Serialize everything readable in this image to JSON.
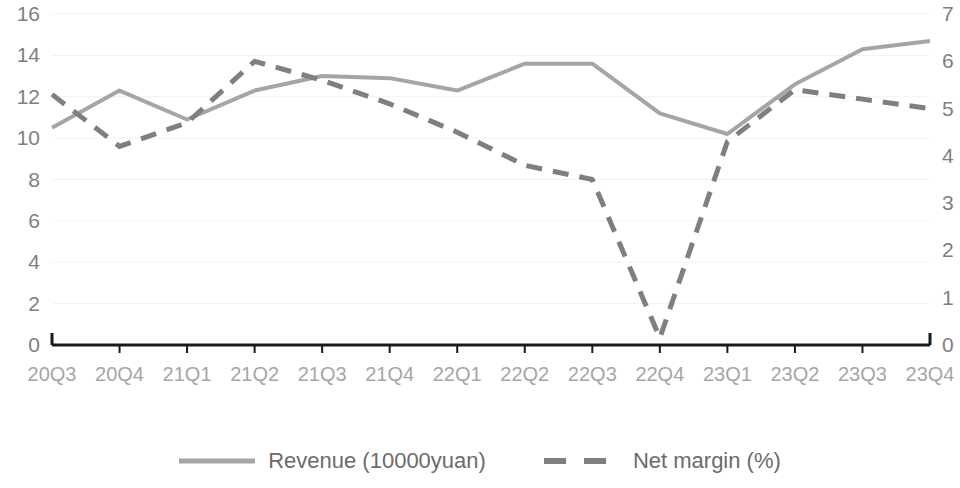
{
  "chart_data": {
    "type": "line",
    "title": "",
    "xlabel": "",
    "categories": [
      "20Q3",
      "20Q4",
      "21Q1",
      "21Q2",
      "21Q3",
      "21Q4",
      "22Q1",
      "22Q2",
      "22Q3",
      "22Q4",
      "23Q1",
      "23Q2",
      "23Q3",
      "23Q4"
    ],
    "grid": true,
    "legend_position": "bottom",
    "series": [
      {
        "name": "Revenue (10000yuan)",
        "axis": "left",
        "style": "solid",
        "color": "#a5a5a5",
        "ylabel": "Revenue (10000yuan)",
        "ylim": [
          0,
          16
        ],
        "yticks": [
          0,
          2,
          4,
          6,
          8,
          10,
          12,
          14,
          16
        ],
        "values": [
          10.5,
          12.3,
          10.9,
          12.3,
          13.0,
          12.9,
          12.3,
          13.6,
          13.6,
          11.2,
          10.2,
          12.6,
          14.3,
          14.7
        ]
      },
      {
        "name": "Net margin (%)",
        "axis": "right",
        "style": "dashed",
        "color": "#7f7f7f",
        "ylabel": "Net margin (%)",
        "ylim": [
          0,
          7
        ],
        "yticks": [
          0,
          1,
          2,
          3,
          4,
          5,
          6,
          7
        ],
        "values": [
          5.3,
          4.2,
          4.7,
          6.0,
          5.6,
          5.1,
          4.5,
          3.8,
          3.5,
          0.15,
          4.3,
          5.4,
          5.2,
          5.0
        ]
      }
    ]
  },
  "axes": {
    "left_ticks": [
      "16",
      "14",
      "12",
      "10",
      "8",
      "6",
      "4",
      "2",
      "0"
    ],
    "right_ticks": [
      "7",
      "6",
      "5",
      "4",
      "3",
      "2",
      "1",
      "0"
    ]
  },
  "legend": {
    "items": [
      {
        "label": "Revenue (10000yuan)",
        "style": "solid",
        "color": "#a5a5a5"
      },
      {
        "label": "Net margin (%)",
        "style": "dashed",
        "color": "#7f7f7f"
      }
    ]
  }
}
